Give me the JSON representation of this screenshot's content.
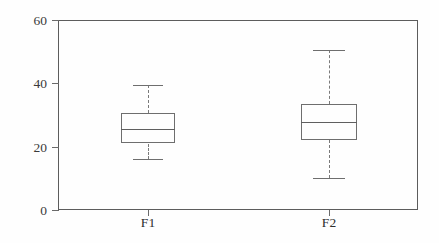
{
  "chart_data": {
    "type": "box",
    "title": "",
    "xlabel": "",
    "ylabel": "Temperatur / °C",
    "categories": [
      "F1",
      "F2"
    ],
    "ylim": [
      0,
      60
    ],
    "yticks": [
      0,
      20,
      40,
      60
    ],
    "ytick_labels": [
      "0",
      "20",
      "40",
      "60"
    ],
    "grid": false,
    "legend": "none",
    "boxes": [
      {
        "name": "F1",
        "whisker_low": 16,
        "q1": 21,
        "median": 25.5,
        "q3": 30.5,
        "whisker_high": 39.5
      },
      {
        "name": "F2",
        "whisker_low": 10,
        "q1": 22,
        "median": 27.8,
        "q3": 33.5,
        "whisker_high": 50.5
      }
    ]
  },
  "axis": {
    "y_title": "Temperatur / °C",
    "y_labels": [
      "0",
      "20",
      "40",
      "60"
    ],
    "x_labels": [
      "F1",
      "F2"
    ]
  },
  "colors": {
    "frame": "#5c5c5c",
    "box_stroke": "#6e6e6e",
    "whisker": "#7a7a7a",
    "text": "#2e2e2e",
    "background": "#fefefe"
  }
}
